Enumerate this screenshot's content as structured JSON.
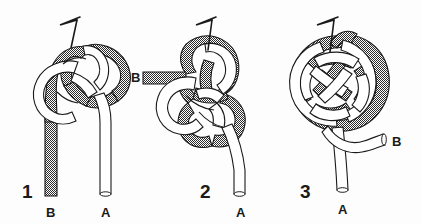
{
  "figure": {
    "background_color": "#fdfdfd",
    "width": 421,
    "height": 224
  },
  "style": {
    "cord_shaded_fill": "#8c8c8c",
    "cord_white_fill": "#ffffff",
    "outline_color": "#1a1a1a",
    "pin_color": "#1a1a1a",
    "label_color": "#1a1a1a"
  },
  "cords": [
    {
      "id": "shaded",
      "name": "stippled-cord",
      "end_label": "B",
      "fill": "#8c8c8c"
    },
    {
      "id": "white",
      "name": "white-cord",
      "end_label": "A",
      "fill": "#ffffff"
    }
  ],
  "steps": [
    {
      "number": "1",
      "name": "step-one",
      "number_x": 22,
      "number_y": 198,
      "pin": true,
      "labels": [
        {
          "text": "B",
          "x": 50,
          "y": 217,
          "name": "label-b-step-one"
        },
        {
          "text": "A",
          "x": 100,
          "y": 217,
          "name": "label-a-step-one"
        },
        {
          "text": "B",
          "x": 133,
          "y": 79,
          "name": "label-b-loop-step-one"
        }
      ]
    },
    {
      "number": "2",
      "name": "step-two",
      "number_x": 200,
      "number_y": 198,
      "pin": true,
      "labels": [
        {
          "text": "B",
          "x": 137,
          "y": 79,
          "name": "label-b-step-two"
        },
        {
          "text": "A",
          "x": 241,
          "y": 217,
          "name": "label-a-step-two"
        }
      ]
    },
    {
      "number": "3",
      "name": "step-three",
      "number_x": 300,
      "number_y": 198,
      "pin": true,
      "labels": [
        {
          "text": "A",
          "x": 337,
          "y": 217,
          "name": "label-a-step-three"
        },
        {
          "text": "B",
          "x": 390,
          "y": 148,
          "name": "label-b-step-three"
        }
      ]
    }
  ]
}
